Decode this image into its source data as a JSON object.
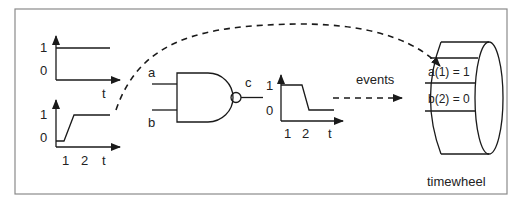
{
  "diagram": {
    "input_a_waveform": {
      "y_labels": [
        "1",
        "0"
      ],
      "x_label": "t",
      "description": "constant high (1)"
    },
    "input_b_waveform": {
      "y_labels": [
        "1",
        "0"
      ],
      "x_ticks": [
        "1",
        "2"
      ],
      "x_label": "t",
      "description": "rises from 0 to 1 between t=1 and t=2"
    },
    "gate": {
      "type": "NAND",
      "inputs": [
        "a",
        "b"
      ],
      "output": "c"
    },
    "output_c_waveform": {
      "y_labels": [
        "1",
        "0"
      ],
      "x_ticks": [
        "1",
        "2"
      ],
      "x_label": "t",
      "description": "falls from 1 to 0 near t=2"
    },
    "arrows": {
      "events_label": "events"
    },
    "timewheel": {
      "label": "timewheel",
      "slots": [
        "a(1) = 1",
        "b(2) = 0"
      ]
    }
  }
}
